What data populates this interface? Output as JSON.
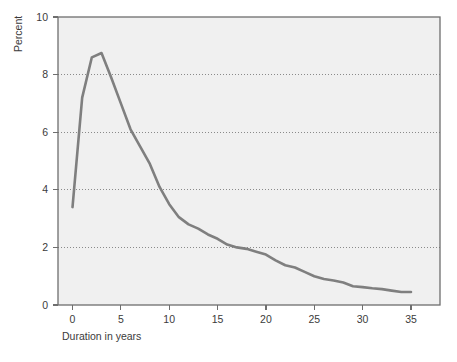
{
  "chart_data": {
    "type": "line",
    "title": "",
    "subtitle": "",
    "xlabel": "Duration in years",
    "ylabel": "Percent",
    "xlim": [
      -1.5,
      38
    ],
    "ylim": [
      0,
      10
    ],
    "xticks": [
      0,
      5,
      10,
      15,
      20,
      25,
      30,
      35
    ],
    "xtick_labels": [
      "0",
      "5",
      "10",
      "15",
      "20",
      "25",
      "30",
      "35"
    ],
    "yticks": [
      0,
      2,
      4,
      6,
      8,
      10
    ],
    "ytick_labels": [
      "0",
      "2",
      "4",
      "6",
      "8",
      "10"
    ],
    "grid": "horizontal-dotted",
    "legend": "none",
    "annotations": [],
    "series": [
      {
        "name": "Percent by duration",
        "color": "#7f7f7f",
        "line_width": 2.6,
        "x": [
          0,
          1,
          2,
          3,
          4,
          5,
          6,
          7,
          8,
          9,
          10,
          11,
          12,
          13,
          14,
          15,
          16,
          17,
          18,
          19,
          20,
          21,
          22,
          23,
          24,
          25,
          26,
          27,
          28,
          29,
          30,
          31,
          32,
          33,
          34,
          35
        ],
        "y": [
          3.4,
          7.2,
          8.6,
          8.75,
          7.9,
          7.0,
          6.1,
          5.5,
          4.9,
          4.1,
          3.5,
          3.05,
          2.8,
          2.65,
          2.45,
          2.3,
          2.1,
          2.0,
          1.95,
          1.85,
          1.75,
          1.55,
          1.38,
          1.3,
          1.15,
          1.0,
          0.9,
          0.85,
          0.78,
          0.65,
          0.62,
          0.58,
          0.55,
          0.5,
          0.45,
          0.45
        ]
      }
    ]
  },
  "figure": {
    "background_color": "#ffffff",
    "plot_background_color": "#f0f0f0",
    "frame_color": "#6e6e6e",
    "grid_color": "#8a8a8a",
    "tick_color": "#6e6e6e",
    "text_color": "#3b3b3b"
  }
}
